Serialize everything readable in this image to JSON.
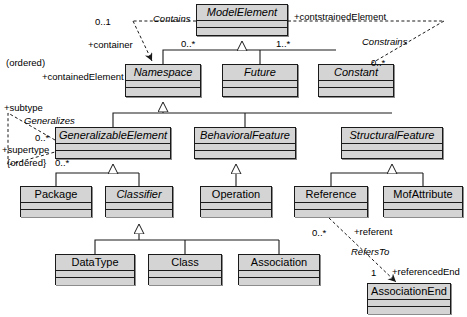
{
  "diagram": {
    "type": "uml-class-diagram",
    "background": "#ffffff",
    "box_fill": "#d4d4d4",
    "line_color": "#1a1a1a"
  },
  "classes": [
    {
      "id": "model-element",
      "name": "ModelElement",
      "abstract": true,
      "x": 196,
      "y": 4,
      "w": 92,
      "h": 32
    },
    {
      "id": "namespace",
      "name": "Namespace",
      "abstract": true,
      "x": 125,
      "y": 64,
      "w": 76,
      "h": 33
    },
    {
      "id": "future",
      "name": "Future",
      "abstract": true,
      "x": 222,
      "y": 64,
      "w": 76,
      "h": 33
    },
    {
      "id": "constant",
      "name": "Constant",
      "abstract": true,
      "x": 318,
      "y": 64,
      "w": 76,
      "h": 33
    },
    {
      "id": "generalizable-element",
      "name": "GeneralizableElement",
      "abstract": true,
      "x": 55,
      "y": 127,
      "w": 116,
      "h": 32
    },
    {
      "id": "behavioral-feature",
      "name": "BehavioralFeature",
      "abstract": true,
      "x": 194,
      "y": 127,
      "w": 102,
      "h": 32
    },
    {
      "id": "structural-feature",
      "name": "StructuralFeature",
      "abstract": true,
      "x": 341,
      "y": 127,
      "w": 102,
      "h": 32
    },
    {
      "id": "package",
      "name": "Package",
      "abstract": false,
      "x": 20,
      "y": 186,
      "w": 72,
      "h": 31
    },
    {
      "id": "classifier",
      "name": "Classifier",
      "abstract": true,
      "x": 105,
      "y": 186,
      "w": 68,
      "h": 31
    },
    {
      "id": "operation",
      "name": "Operation",
      "abstract": false,
      "x": 200,
      "y": 186,
      "w": 72,
      "h": 31
    },
    {
      "id": "reference",
      "name": "Reference",
      "abstract": false,
      "x": 294,
      "y": 186,
      "w": 74,
      "h": 31
    },
    {
      "id": "mof-attribute",
      "name": "MofAttribute",
      "abstract": false,
      "x": 383,
      "y": 186,
      "w": 80,
      "h": 31
    },
    {
      "id": "data-type",
      "name": "DataType",
      "abstract": false,
      "x": 55,
      "y": 254,
      "w": 80,
      "h": 31
    },
    {
      "id": "class",
      "name": "Class",
      "abstract": false,
      "x": 148,
      "y": 254,
      "w": 74,
      "h": 31
    },
    {
      "id": "association",
      "name": "Association",
      "abstract": false,
      "x": 238,
      "y": 254,
      "w": 82,
      "h": 31
    },
    {
      "id": "association-end",
      "name": "AssociationEnd",
      "abstract": false,
      "x": 367,
      "y": 283,
      "w": 84,
      "h": 31
    }
  ],
  "labels": [
    {
      "id": "mult-contains-source",
      "text": "0..1",
      "x": 95,
      "y": 17,
      "italic": false
    },
    {
      "id": "assoc-contains",
      "text": "Contains",
      "x": 153,
      "y": 14,
      "italic": true
    },
    {
      "id": "role-constrained",
      "text": "+contstrainedElement",
      "x": 294,
      "y": 12,
      "italic": false
    },
    {
      "id": "role-container",
      "text": "+container",
      "x": 88,
      "y": 40,
      "italic": false
    },
    {
      "id": "mult-namespace-gen",
      "text": "0..*",
      "x": 181,
      "y": 39,
      "italic": false
    },
    {
      "id": "mult-future-gen",
      "text": "1..*",
      "x": 276,
      "y": 39,
      "italic": false
    },
    {
      "id": "assoc-constrains",
      "text": "Constrains",
      "x": 362,
      "y": 37,
      "italic": true
    },
    {
      "id": "qual-ordered-contains",
      "text": "(ordered)",
      "x": 6,
      "y": 58,
      "italic": false
    },
    {
      "id": "role-contained",
      "text": "+containedElement",
      "x": 42,
      "y": 72,
      "italic": false
    },
    {
      "id": "mult-constrains",
      "text": "0..*",
      "x": 371,
      "y": 58,
      "italic": false
    },
    {
      "id": "role-subtype",
      "text": "+subtype",
      "x": 4,
      "y": 103,
      "italic": false
    },
    {
      "id": "assoc-generalizes",
      "text": "Generalizes",
      "x": 24,
      "y": 116,
      "italic": true
    },
    {
      "id": "mult-subtype",
      "text": "0..*",
      "x": 35,
      "y": 133,
      "italic": false
    },
    {
      "id": "role-supertype",
      "text": "+supertype",
      "x": 2,
      "y": 145,
      "italic": false
    },
    {
      "id": "qual-ordered-gen",
      "text": "{ordered}",
      "x": 7,
      "y": 158,
      "italic": false
    },
    {
      "id": "mult-supertype",
      "text": "0..*",
      "x": 55,
      "y": 158,
      "italic": false
    },
    {
      "id": "mult-referent",
      "text": "0..*",
      "x": 312,
      "y": 228,
      "italic": false
    },
    {
      "id": "role-referent",
      "text": "+referent",
      "x": 354,
      "y": 227,
      "italic": false
    },
    {
      "id": "assoc-refersto",
      "text": "RefersTo",
      "x": 351,
      "y": 247,
      "italic": true
    },
    {
      "id": "mult-referenced-end",
      "text": "1",
      "x": 371,
      "y": 268,
      "italic": false
    },
    {
      "id": "role-referenced-end",
      "text": "+referencedEnd",
      "x": 392,
      "y": 267,
      "italic": false
    }
  ]
}
